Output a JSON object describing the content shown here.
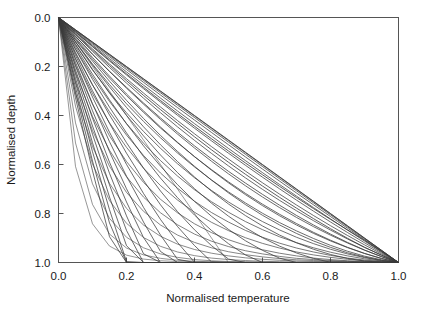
{
  "figure": {
    "background": "#ffffff",
    "frame_color": "#555555",
    "curve_color": "#3a3a3a"
  },
  "chart_data": {
    "type": "line",
    "title": "",
    "xlabel": "Normalised temperature",
    "ylabel": "Normalised depth",
    "xlim": [
      0.0,
      1.0
    ],
    "ylim": [
      1.0,
      0.0
    ],
    "y_axis_inverted": true,
    "grid": false,
    "legend": null,
    "xticks": [
      0.0,
      0.2,
      0.4,
      0.6,
      0.8,
      1.0
    ],
    "xticklabels": [
      "0.0",
      "0.2",
      "0.4",
      "0.6",
      "0.8",
      "1.0"
    ],
    "yticks": [
      0.0,
      0.2,
      0.4,
      0.6,
      0.8,
      1.0
    ],
    "yticklabels": [
      "0.0",
      "0.2",
      "0.4",
      "0.6",
      "0.8",
      "1.0"
    ],
    "x": [
      0.0,
      0.05,
      0.1,
      0.15,
      0.2,
      0.25,
      0.3,
      0.35,
      0.4,
      0.45,
      0.5,
      0.55,
      0.6,
      0.65,
      0.7,
      0.75,
      0.8,
      0.85,
      0.9,
      0.95,
      1.0
    ],
    "series": [
      {
        "name": "profile-01",
        "curvature": 0.0,
        "values": [
          0.0,
          0.05,
          0.1,
          0.15,
          0.2,
          0.25,
          0.3,
          0.35,
          0.4,
          0.45,
          0.5,
          0.55,
          0.6,
          0.65,
          0.7,
          0.75,
          0.8,
          0.85,
          0.9,
          0.95,
          1.0
        ]
      },
      {
        "name": "profile-02",
        "curvature": 0.04,
        "values": [
          0.0,
          0.059,
          0.117,
          0.174,
          0.23,
          0.285,
          0.339,
          0.392,
          0.444,
          0.495,
          0.545,
          0.594,
          0.642,
          0.689,
          0.735,
          0.78,
          0.824,
          0.867,
          0.909,
          0.955,
          1.0
        ]
      },
      {
        "name": "profile-03",
        "curvature": 0.08,
        "values": [
          0.0,
          0.068,
          0.133,
          0.196,
          0.258,
          0.318,
          0.376,
          0.432,
          0.487,
          0.54,
          0.591,
          0.64,
          0.688,
          0.734,
          0.778,
          0.821,
          0.862,
          0.901,
          0.938,
          0.97,
          1.0
        ]
      },
      {
        "name": "profile-04",
        "curvature": 0.12,
        "values": [
          0.0,
          0.077,
          0.15,
          0.219,
          0.285,
          0.349,
          0.41,
          0.468,
          0.524,
          0.577,
          0.628,
          0.676,
          0.722,
          0.766,
          0.808,
          0.847,
          0.884,
          0.918,
          0.949,
          0.976,
          1.0
        ]
      },
      {
        "name": "profile-05",
        "curvature": 0.17,
        "values": [
          0.0,
          0.088,
          0.17,
          0.247,
          0.319,
          0.387,
          0.451,
          0.511,
          0.568,
          0.621,
          0.671,
          0.718,
          0.762,
          0.803,
          0.841,
          0.877,
          0.909,
          0.938,
          0.963,
          0.984,
          1.0
        ]
      },
      {
        "name": "profile-06",
        "curvature": 0.22,
        "values": [
          0.0,
          0.099,
          0.19,
          0.274,
          0.352,
          0.424,
          0.491,
          0.553,
          0.61,
          0.663,
          0.712,
          0.757,
          0.799,
          0.837,
          0.871,
          0.902,
          0.93,
          0.954,
          0.974,
          0.989,
          1.0
        ]
      },
      {
        "name": "profile-07",
        "curvature": 0.28,
        "values": [
          0.0,
          0.112,
          0.214,
          0.306,
          0.389,
          0.465,
          0.534,
          0.597,
          0.654,
          0.706,
          0.753,
          0.795,
          0.833,
          0.867,
          0.897,
          0.923,
          0.946,
          0.965,
          0.98,
          0.992,
          1.0
        ]
      },
      {
        "name": "profile-08",
        "curvature": 0.35,
        "values": [
          0.0,
          0.128,
          0.242,
          0.343,
          0.433,
          0.513,
          0.584,
          0.647,
          0.703,
          0.752,
          0.795,
          0.833,
          0.866,
          0.895,
          0.919,
          0.94,
          0.958,
          0.973,
          0.985,
          0.994,
          1.0
        ]
      },
      {
        "name": "profile-09",
        "curvature": 0.43,
        "values": [
          0.0,
          0.147,
          0.275,
          0.385,
          0.48,
          0.563,
          0.635,
          0.697,
          0.75,
          0.796,
          0.835,
          0.869,
          0.897,
          0.921,
          0.941,
          0.957,
          0.971,
          0.982,
          0.99,
          0.996,
          1.0
        ]
      },
      {
        "name": "profile-10",
        "curvature": 0.52,
        "values": [
          0.0,
          0.168,
          0.311,
          0.43,
          0.53,
          0.615,
          0.686,
          0.745,
          0.795,
          0.836,
          0.87,
          0.899,
          0.922,
          0.941,
          0.957,
          0.969,
          0.979,
          0.987,
          0.993,
          0.997,
          1.0
        ]
      },
      {
        "name": "profile-11",
        "curvature": 0.62,
        "values": [
          0.0,
          0.194,
          0.354,
          0.483,
          0.588,
          0.673,
          0.742,
          0.797,
          0.842,
          0.878,
          0.907,
          0.93,
          0.948,
          0.962,
          0.973,
          0.982,
          0.988,
          0.993,
          0.996,
          0.999,
          1.0
        ]
      },
      {
        "name": "profile-12",
        "curvature": 0.73,
        "values": [
          0.0,
          0.225,
          0.404,
          0.542,
          0.65,
          0.733,
          0.797,
          0.846,
          0.884,
          0.913,
          0.935,
          0.952,
          0.965,
          0.975,
          0.983,
          0.988,
          0.992,
          0.995,
          0.998,
          0.999,
          1.0
        ]
      },
      {
        "name": "profile-13",
        "curvature": 0.85,
        "values": [
          0.0,
          0.263,
          0.462,
          0.607,
          0.714,
          0.791,
          0.847,
          0.888,
          0.918,
          0.94,
          0.956,
          0.968,
          0.977,
          0.984,
          0.989,
          0.992,
          0.995,
          0.997,
          0.998,
          0.999,
          1.0
        ]
      },
      {
        "name": "profile-14",
        "curvature": 0.98,
        "values": [
          0.0,
          0.308,
          0.527,
          0.677,
          0.779,
          0.847,
          0.893,
          0.925,
          0.947,
          0.962,
          0.973,
          0.981,
          0.987,
          0.991,
          0.994,
          0.996,
          0.997,
          0.998,
          0.999,
          1.0,
          1.0
        ]
      },
      {
        "name": "profile-15",
        "curvature": 1.12,
        "values": [
          0.0,
          0.362,
          0.598,
          0.747,
          0.84,
          0.898,
          0.934,
          0.957,
          0.972,
          0.982,
          0.988,
          0.992,
          0.995,
          0.997,
          0.998,
          0.999,
          0.999,
          1.0,
          1.0,
          1.0,
          1.0
        ]
      },
      {
        "name": "profile-16",
        "curvature": 1.3,
        "values": [
          0.0,
          0.43,
          0.679,
          0.82,
          0.897,
          0.94,
          0.965,
          0.979,
          0.988,
          0.993,
          0.996,
          0.997,
          0.998,
          0.999,
          1.0,
          1.0,
          1.0,
          1.0,
          1.0,
          1.0,
          1.0
        ]
      },
      {
        "name": "profile-17",
        "curvature": 1.5,
        "values": [
          0.0,
          0.512,
          0.763,
          0.884,
          0.941,
          0.969,
          0.983,
          0.991,
          0.995,
          0.997,
          0.998,
          0.999,
          1.0,
          1.0,
          1.0,
          1.0,
          1.0,
          1.0,
          1.0,
          1.0,
          1.0
        ]
      },
      {
        "name": "profile-18",
        "curvature": 1.75,
        "values": [
          0.0,
          0.608,
          0.842,
          0.933,
          0.97,
          0.986,
          0.993,
          0.996,
          0.998,
          0.999,
          1.0,
          1.0,
          1.0,
          1.0,
          1.0,
          1.0,
          1.0,
          1.0,
          1.0,
          1.0,
          1.0
        ]
      },
      {
        "name": "profile-19-extreme",
        "curvature": 2.2,
        "reaches_unit_depth_at_x": 0.5,
        "values": [
          0.0,
          0.1,
          0.2,
          0.3,
          0.4,
          0.5,
          0.6,
          0.7,
          0.8,
          0.9,
          1.0,
          1.0,
          1.0,
          1.0,
          1.0,
          1.0,
          1.0,
          1.0,
          1.0,
          1.0,
          1.0
        ]
      }
    ]
  },
  "axes": {
    "x_title": "Normalised temperature",
    "y_title": "Normalised depth",
    "x_tick_labels": [
      "0.0",
      "0.2",
      "0.4",
      "0.6",
      "0.8",
      "1.0"
    ],
    "y_tick_labels": [
      "0.0",
      "0.2",
      "0.4",
      "0.6",
      "0.8",
      "1.0"
    ]
  }
}
